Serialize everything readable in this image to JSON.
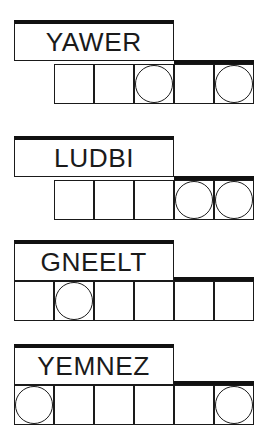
{
  "puzzles": [
    {
      "word": "YAWER",
      "cells": 5,
      "circled": [
        2,
        4
      ]
    },
    {
      "word": "LUDBI",
      "cells": 5,
      "circled": [
        3,
        4
      ]
    },
    {
      "word": "GNEELT",
      "cells": 6,
      "circled": [
        1
      ]
    },
    {
      "word": "YEMNEZ",
      "cells": 6,
      "circled": [
        0,
        5
      ]
    }
  ]
}
